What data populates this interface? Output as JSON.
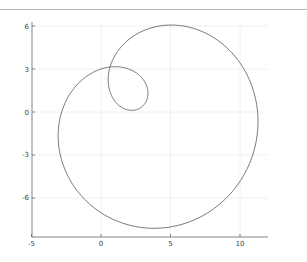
{
  "chart_data": {
    "type": "line",
    "title": "",
    "xlabel": "",
    "ylabel": "",
    "xlim": [
      -5,
      12
    ],
    "ylim": [
      -9,
      6.5
    ],
    "grid": true,
    "legend": null,
    "xticks": [
      -5,
      0,
      5,
      10
    ],
    "xtick_labels": [
      "-5",
      "0",
      "5",
      "10"
    ],
    "yticks": [
      6,
      3,
      0,
      -3,
      -6
    ],
    "ytick_labels": [
      "6",
      "3",
      "0",
      "-3",
      "-6"
    ],
    "series": [
      {
        "name": "curve",
        "color": "#555555",
        "parametric": {
          "form": "limacon",
          "double_point": [
            0.65,
            3.14
          ],
          "a": 8.0,
          "b": 4.4,
          "axis_angle_deg": -50
        },
        "key_points": [
          {
            "label": "top",
            "x": 4.96,
            "y": 5.86
          },
          {
            "label": "right",
            "x": 11.2,
            "y": -0.55
          },
          {
            "label": "bottom",
            "x": 3.67,
            "y": -8.3
          },
          {
            "label": "left",
            "x": -3.45,
            "y": -1.8
          },
          {
            "label": "self-intersection",
            "x": 0.65,
            "y": 3.14
          },
          {
            "label": "inner-loop-far",
            "x": 2.8,
            "y": 0.14
          }
        ]
      }
    ]
  },
  "layout": {
    "plot_px": {
      "x_origin_px": 101,
      "x_scale": 13.9,
      "y_origin_px": 112,
      "y_scale": 14.33,
      "axis_left_px": 32,
      "axis_bottom_px": 237,
      "axis_right_px": 268,
      "axis_top_px": 22
    },
    "colors": {
      "axis": "#666666",
      "grid": "#f0f0f0",
      "curve": "#555555",
      "label": "#444444"
    }
  }
}
